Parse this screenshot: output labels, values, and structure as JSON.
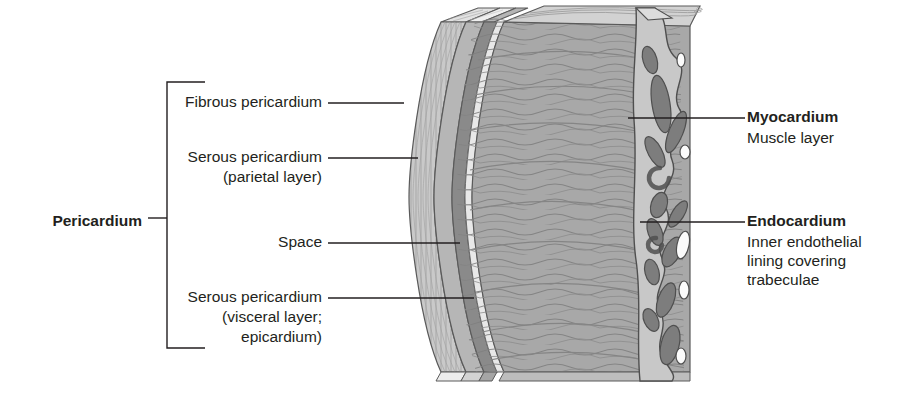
{
  "figure": {
    "type": "anatomical-diagram",
    "background_color": "#ffffff",
    "text_color": "#231f20"
  },
  "labels": {
    "pericardium_group": {
      "text": "Pericardium",
      "bold": true,
      "side": "left",
      "has_bracket": true
    },
    "fibrous_pericardium": {
      "text": "Fibrous pericardium",
      "bold": false,
      "side": "left",
      "has_leader": true
    },
    "serous_parietal": {
      "line1": "Serous pericardium",
      "line2": "(parietal layer)",
      "bold": false,
      "side": "left",
      "has_leader": true
    },
    "space": {
      "text": "Space",
      "bold": false,
      "side": "left",
      "has_leader": true
    },
    "serous_visceral": {
      "line1": "Serous pericardium",
      "line2": "(visceral layer;",
      "line3": "epicardium)",
      "bold": false,
      "side": "left",
      "has_leader": true
    },
    "myocardium": {
      "title": "Myocardium",
      "description": "Muscle layer",
      "bold_title": true,
      "side": "right",
      "has_leader": true
    },
    "endocardium": {
      "title": "Endocardium",
      "description": "Inner endothelial\nlining covering\ntrabeculae",
      "bold_title": true,
      "side": "right",
      "has_leader": true
    }
  },
  "layers": [
    {
      "name": "fibrous-pericardium",
      "fill": "#c9c9c9",
      "hatch": true
    },
    {
      "name": "serous-parietal-layer",
      "fill": "#b3b3b3",
      "hatch": false
    },
    {
      "name": "pericardial-space",
      "fill": "#8c8c8c",
      "hatch": false
    },
    {
      "name": "serous-visceral-epicardium",
      "fill": "#d8d8d8",
      "hatch": false
    },
    {
      "name": "myocardium",
      "fill": "#a8a8a8",
      "hatch": true
    },
    {
      "name": "endocardium",
      "fill": "#c8c8c8",
      "hatch": false
    },
    {
      "name": "trabeculae",
      "fill": "#7d7d7d",
      "hatch": false
    }
  ],
  "colors": {
    "outline": "#4d4d4d",
    "leader": "#231f20",
    "fibrous": "#c9c9c9",
    "parietal": "#b3b3b3",
    "space": "#8c8c8c",
    "visceral": "#dcdcdc",
    "myocardium": "#a8a8a8",
    "myocardium_top": "#cfcfcf",
    "endocardium": "#c8c8c8",
    "trabecula": "#7d7d7d",
    "lumen": "#fafafa"
  }
}
